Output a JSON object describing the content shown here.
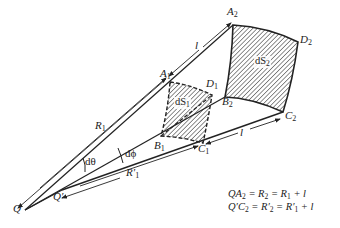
{
  "figure": {
    "points": {
      "Q": "Q",
      "Q_prime": "Q′",
      "A1": "A",
      "A1_sub": "1",
      "A2": "A",
      "A2_sub": "2",
      "B1": "B",
      "B1_sub": "1",
      "B2": "B",
      "B2_sub": "2",
      "C1": "C",
      "C1_sub": "1",
      "C2": "C",
      "C2_sub": "2",
      "D1": "D",
      "D1_sub": "1",
      "D2": "D",
      "D2_sub": "2"
    },
    "areas": {
      "dS1": "dS",
      "dS1_sub": "1",
      "dS2": "dS",
      "dS2_sub": "2"
    },
    "dimensions": {
      "R1": "R",
      "R1_sub": "1",
      "R1_prime": "R′",
      "R1_prime_sub": "1",
      "l_upper": "l",
      "l_lower": "l"
    },
    "angles": {
      "d_theta": "dθ",
      "d_phi": "dϕ"
    },
    "equations": [
      {
        "lhs": "QA",
        "lhs_sub": "2",
        "mid": " = R",
        "mid_sub": "2",
        "rhs": " = R",
        "rhs_sub": "1",
        "tail": " + l"
      },
      {
        "lhs": "Q′C",
        "lhs_sub": "2",
        "mid": " = R′",
        "mid_sub": "2",
        "rhs": " = R′",
        "rhs_sub": "1",
        "tail": " + l"
      }
    ],
    "colors": {
      "line": "#222222",
      "hatch": "#333333",
      "background": "#ffffff"
    }
  }
}
